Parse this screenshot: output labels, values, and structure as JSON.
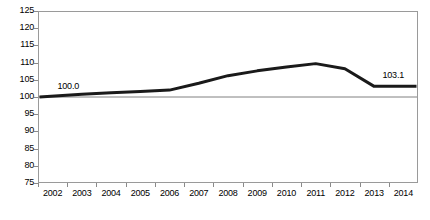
{
  "chart_data": {
    "type": "line",
    "title": "",
    "subtitle": "",
    "xlabel": "",
    "ylabel": "",
    "categories": [
      "2002",
      "2003",
      "2004",
      "2005",
      "2006",
      "2007",
      "2008",
      "2009",
      "2010",
      "2011",
      "2012",
      "2013",
      "2014"
    ],
    "series": [
      {
        "name": "Index",
        "values": [
          100.0,
          100.8,
          101.2,
          101.6,
          102.0,
          104.0,
          106.2,
          107.6,
          108.7,
          109.7,
          108.2,
          103.1,
          103.1
        ],
        "color": "#1a1a1a",
        "line_width": 3
      }
    ],
    "reference_line": {
      "name": "baseline-100",
      "value": 100.0,
      "color": "#808080"
    },
    "ylim": [
      75,
      125
    ],
    "ytick_step": 5,
    "yticks": [
      "125",
      "120",
      "115",
      "110",
      "105",
      "100",
      "95",
      "90",
      "85",
      "80",
      "75"
    ],
    "grid": false,
    "legend": null,
    "legend_position": "none",
    "annotations": [
      {
        "name": "start-value-label",
        "text": "100.0",
        "category": "2002",
        "value": 100.0
      },
      {
        "name": "end-value-label",
        "text": "103.1",
        "category": "2014",
        "value": 103.1
      }
    ],
    "axis_color": "#9a9a9a",
    "plot_background": "#ffffff"
  }
}
